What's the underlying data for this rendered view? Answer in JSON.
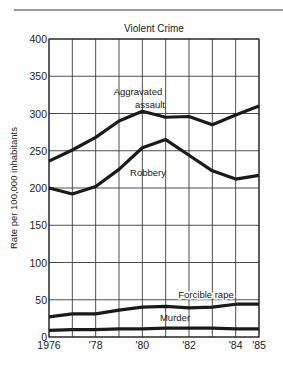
{
  "chart_data": {
    "type": "line",
    "title": "Violent Crime",
    "xlabel": "",
    "ylabel": "Rate per 100,000 inhabitants",
    "x": [
      1976,
      1977,
      1978,
      1979,
      1980,
      1981,
      1982,
      1983,
      1984,
      1985
    ],
    "x_tick_labels": [
      "1976",
      "'78",
      "'80",
      "'82",
      "'84",
      "'85"
    ],
    "x_tick_positions": [
      1976,
      1978,
      1980,
      1982,
      1984,
      1985
    ],
    "y_ticks": [
      0,
      50,
      100,
      150,
      200,
      250,
      300,
      350,
      400
    ],
    "ylim": [
      0,
      400
    ],
    "grid": true,
    "legend_position": "inline labels",
    "series": [
      {
        "name": "Aggravated assault",
        "label_lines": [
          "Aggravated",
          "assault"
        ],
        "values": [
          236,
          251,
          268,
          290,
          303,
          295,
          296,
          285,
          298,
          310
        ]
      },
      {
        "name": "Robbery",
        "label_lines": [
          "Robbery"
        ],
        "values": [
          200,
          192,
          202,
          225,
          254,
          265,
          244,
          223,
          212,
          217
        ]
      },
      {
        "name": "Forcible rape",
        "label_lines": [
          "Forcible rape"
        ],
        "values": [
          27,
          31,
          31,
          36,
          40,
          41,
          39,
          40,
          44,
          44
        ]
      },
      {
        "name": "Murder",
        "label_lines": [
          "Murder"
        ],
        "values": [
          9,
          10,
          10,
          11,
          11,
          12,
          12,
          12,
          11,
          11
        ]
      }
    ]
  },
  "colors": {
    "line": "#1a1a1a",
    "grid": "#3a3a3a",
    "background": "#ffffff"
  }
}
